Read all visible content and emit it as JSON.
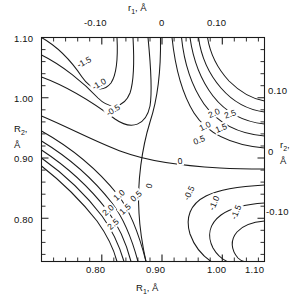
{
  "figure": {
    "background_color": "#ffffff",
    "line_color": "#1a1a1a",
    "text_color": "#111111"
  },
  "axes": {
    "bottom": {
      "title_main": "R",
      "title_sub": "1",
      "title_unit": ", Å",
      "tick_labels": [
        "0.80",
        "0.90",
        "1.00",
        "1.10"
      ],
      "tick_values": [
        0.8,
        0.9,
        1.0,
        1.1
      ],
      "range": [
        0.748,
        1.118
      ],
      "minor_step": 0.02
    },
    "top": {
      "title_main": "r",
      "title_sub": "1",
      "title_unit": ", Å",
      "tick_labels": [
        "-0.10",
        "0",
        "0.10"
      ],
      "tick_values": [
        -0.1,
        0.0,
        0.1
      ],
      "range": [
        -0.152,
        0.218
      ],
      "minor_step": 0.02
    },
    "left": {
      "title_main": "R",
      "title_sub": "2",
      "title_unit": ",",
      "title_unit_line2": "Å",
      "tick_labels": [
        "1.10",
        "1.00",
        "0.90",
        "0.80"
      ],
      "tick_values": [
        1.1,
        1.0,
        0.9,
        0.8
      ],
      "range": [
        0.748,
        1.118
      ],
      "minor_step": 0.02
    },
    "right": {
      "title_main": "r",
      "title_sub": "2",
      "title_unit": ",",
      "title_unit_line2": "Å",
      "tick_labels": [
        "0.10",
        "0",
        "-0.10"
      ],
      "tick_values": [
        0.1,
        0.0,
        -0.1
      ],
      "range": [
        -0.152,
        0.218
      ],
      "minor_step": 0.02
    }
  },
  "chart_data": {
    "type": "contour",
    "title": "",
    "xlabel": "R1, Å",
    "ylabel": "R2, Å",
    "xlabel_secondary": "r1, Å",
    "ylabel_secondary": "r2, Å",
    "xlim": [
      0.748,
      1.118
    ],
    "ylim": [
      0.748,
      1.118
    ],
    "grid": false,
    "legend": false,
    "contour_levels": [
      -2.5,
      -2.0,
      -1.5,
      -1.0,
      -0.5,
      0,
      0.5,
      1.0,
      1.5,
      2.0,
      2.5
    ],
    "level_step": 0.5,
    "saddle_point": {
      "x": 0.925,
      "y": 0.932
    },
    "labels": [
      {
        "text": "-1.5",
        "x": 0.818,
        "y": 1.077,
        "rotation": -28
      },
      {
        "text": "-1.0",
        "x": 0.843,
        "y": 1.041,
        "rotation": -30
      },
      {
        "text": "-0.5",
        "x": 0.866,
        "y": 0.998,
        "rotation": -32
      },
      {
        "text": "2.0",
        "x": 1.035,
        "y": 0.993,
        "rotation": -24
      },
      {
        "text": "2.5",
        "x": 1.061,
        "y": 0.991,
        "rotation": -20
      },
      {
        "text": "1.0",
        "x": 1.02,
        "y": 0.971,
        "rotation": -26
      },
      {
        "text": "1.5",
        "x": 1.046,
        "y": 0.969,
        "rotation": -22
      },
      {
        "text": "0.5",
        "x": 1.01,
        "y": 0.948,
        "rotation": -22
      },
      {
        "text": "0",
        "x": 0.977,
        "y": 0.914,
        "rotation": -6
      },
      {
        "text": "0",
        "x": 0.926,
        "y": 0.872,
        "rotation": -74
      },
      {
        "text": "0.5",
        "x": 0.905,
        "y": 0.857,
        "rotation": -42
      },
      {
        "text": "1.0",
        "x": 0.877,
        "y": 0.858,
        "rotation": -42
      },
      {
        "text": "1.5",
        "x": 0.886,
        "y": 0.834,
        "rotation": -42
      },
      {
        "text": "2.0",
        "x": 0.858,
        "y": 0.833,
        "rotation": -42
      },
      {
        "text": "2.5",
        "x": 0.866,
        "y": 0.81,
        "rotation": -42
      },
      {
        "text": "-0.5",
        "x": 0.993,
        "y": 0.861,
        "rotation": -64
      },
      {
        "text": "-1.0",
        "x": 1.035,
        "y": 0.845,
        "rotation": -66
      },
      {
        "text": "-1.5",
        "x": 1.07,
        "y": 0.829,
        "rotation": -68
      }
    ]
  }
}
